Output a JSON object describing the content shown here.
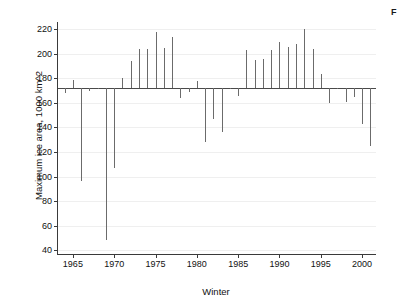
{
  "caption": {
    "fragment": "F"
  },
  "chart_data": {
    "type": "bar",
    "title": "",
    "xlabel": "Winter",
    "ylabel": "Maximum ice area, 1000 km^2",
    "baseline": 172,
    "xlim": [
      1963.2,
      2001.8
    ],
    "ylim": [
      36,
      226
    ],
    "grid": true,
    "legend": "none",
    "ytick_labels": [
      "40",
      "60",
      "80",
      "100",
      "120",
      "140",
      "160",
      "180",
      "200",
      "220"
    ],
    "yticks": [
      40,
      60,
      80,
      100,
      120,
      140,
      160,
      180,
      200,
      220
    ],
    "xtick_labels": [
      "1965",
      "1970",
      "1975",
      "1980",
      "1985",
      "1990",
      "1995",
      "2000"
    ],
    "xticks": [
      1965,
      1970,
      1975,
      1980,
      1985,
      1990,
      1995,
      2000
    ],
    "x": [
      1964,
      1965,
      1966,
      1967,
      1968,
      1969,
      1970,
      1971,
      1972,
      1973,
      1974,
      1975,
      1976,
      1977,
      1978,
      1979,
      1980,
      1981,
      1982,
      1983,
      1984,
      1985,
      1986,
      1987,
      1988,
      1989,
      1990,
      1991,
      1992,
      1993,
      1994,
      1995,
      1996,
      1997,
      1998,
      1999,
      2000,
      2001
    ],
    "values": [
      168,
      179,
      96,
      170,
      171,
      48,
      107,
      180,
      194,
      204,
      204,
      218,
      205,
      214,
      164,
      169,
      178,
      128,
      147,
      136,
      171,
      166,
      203,
      195,
      196,
      203,
      210,
      206,
      208,
      220,
      204,
      184,
      160,
      172,
      161,
      165,
      143,
      125
    ]
  }
}
